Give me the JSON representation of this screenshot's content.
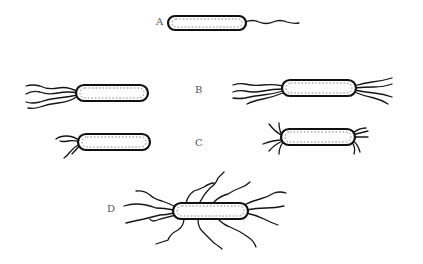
{
  "diagram": {
    "panels": [
      {
        "label": "A",
        "type": "monotrichous",
        "cells": 1
      },
      {
        "label": "B",
        "type": "lophotrichous",
        "cells": 2
      },
      {
        "label": "C",
        "type": "amphitrichous",
        "cells": 2
      },
      {
        "label": "D",
        "type": "peritrichous",
        "cells": 1
      }
    ]
  },
  "labels": {
    "a": "A",
    "b": "B",
    "c": "C",
    "d": "D"
  },
  "colors": {
    "ink": "#111111",
    "background": "#ffffff",
    "label": "#555555"
  }
}
